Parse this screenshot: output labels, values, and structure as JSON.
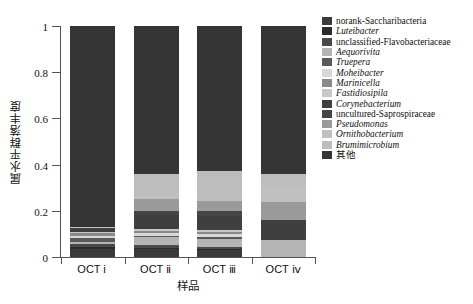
{
  "chart_data": {
    "type": "bar",
    "subtype": "stacked-bar",
    "title": "",
    "xlabel": "样品",
    "ylabel": "属水平群落丰度",
    "categories": [
      "OCT ⅰ",
      "OCT ⅱ",
      "OCT ⅲ",
      "OCT ⅳ"
    ],
    "ylim": [
      0,
      1
    ],
    "yticks": [
      0,
      0.2,
      0.4,
      0.6,
      0.8,
      1
    ],
    "ytick_labels": [
      "0",
      "0.2",
      "0.4",
      "0.6",
      "0.8",
      "1"
    ],
    "grid": false,
    "legend_position": "right",
    "stack_order_bottom_to_top": [
      "norank-Saccharibacteria",
      "Luteibacter",
      "unclassified-Flavobacteriaceae",
      "Aequorivita",
      "Truepera",
      "Moheibacter",
      "Marinicella",
      "Fastidiosipila",
      "Corynebacterium",
      "uncultured-Saprospiraceae",
      "Pseudomonas",
      "Ornithobacterium",
      "Brumimicrobium",
      "其他"
    ],
    "series": [
      {
        "name": "norank-Saccharibacteria",
        "color": "#3a3a3a",
        "values": [
          0.035,
          0.035,
          0.03,
          0.0
        ]
      },
      {
        "name": "Luteibacter",
        "color": "#2b2b2b",
        "values": [
          0.01,
          0.005,
          0.005,
          0.0
        ]
      },
      {
        "name": "unclassified-Flavobacteriaceae",
        "color": "#4a4a4a",
        "values": [
          0.01,
          0.01,
          0.01,
          0.0
        ]
      },
      {
        "name": "Aequorivita",
        "color": "#b4b4b4",
        "values": [
          0.008,
          0.035,
          0.035,
          0.075
        ]
      },
      {
        "name": "Truepera",
        "color": "#5a5a5a",
        "values": [
          0.02,
          0.008,
          0.008,
          0.0
        ]
      },
      {
        "name": "Moheibacter",
        "color": "#d8d8d8",
        "values": [
          0.008,
          0.01,
          0.01,
          0.0
        ]
      },
      {
        "name": "Marinicella",
        "color": "#8a8a8a",
        "values": [
          0.015,
          0.012,
          0.012,
          0.0
        ]
      },
      {
        "name": "Fastidiosipila",
        "color": "#c8c8c8",
        "values": [
          0.004,
          0.008,
          0.008,
          0.0
        ]
      },
      {
        "name": "Corynebacterium",
        "color": "#3f3f3f",
        "values": [
          0.01,
          0.06,
          0.062,
          0.085
        ]
      },
      {
        "name": "uncultured-Saprospiraceae",
        "color": "#454545",
        "values": [
          0.005,
          0.015,
          0.018,
          0.0
        ]
      },
      {
        "name": "Pseudomonas",
        "color": "#9a9a9a",
        "values": [
          0.003,
          0.055,
          0.045,
          0.08
        ]
      },
      {
        "name": "Ornithobacterium",
        "color": "#c0c0c0",
        "values": [
          0.002,
          0.01,
          0.01,
          0.065
        ]
      },
      {
        "name": "Brumimicrobium",
        "color": "#bdbdbd",
        "values": [
          0.0,
          0.097,
          0.12,
          0.055
        ]
      },
      {
        "name": "其他",
        "color": "#353535",
        "values": [
          0.87,
          0.64,
          0.627,
          0.64
        ]
      }
    ]
  },
  "legend": {
    "items": [
      {
        "label": "norank-Saccharibacteria",
        "color": "#3a3a3a",
        "italic": false,
        "cjk": false
      },
      {
        "label": "Luteibacter",
        "color": "#2b2b2b",
        "italic": true,
        "cjk": false
      },
      {
        "label": "unclassified-Flavobacteriaceae",
        "color": "#4a4a4a",
        "italic": false,
        "cjk": false
      },
      {
        "label": "Aequorivita",
        "color": "#b4b4b4",
        "italic": true,
        "cjk": false
      },
      {
        "label": "Truepera",
        "color": "#5a5a5a",
        "italic": true,
        "cjk": false
      },
      {
        "label": "Moheibacter",
        "color": "#d8d8d8",
        "italic": true,
        "cjk": false
      },
      {
        "label": "Marinicella",
        "color": "#8a8a8a",
        "italic": true,
        "cjk": false
      },
      {
        "label": "Fastidiosipila",
        "color": "#c8c8c8",
        "italic": true,
        "cjk": false
      },
      {
        "label": "Corynebacterium",
        "color": "#3f3f3f",
        "italic": true,
        "cjk": false
      },
      {
        "label": "uncultured-Saprospiraceae",
        "color": "#454545",
        "italic": false,
        "cjk": false
      },
      {
        "label": "Pseudomonas",
        "color": "#9a9a9a",
        "italic": true,
        "cjk": false
      },
      {
        "label": "Ornithobacterium",
        "color": "#c0c0c0",
        "italic": true,
        "cjk": false
      },
      {
        "label": "Brumimicrobium",
        "color": "#bdbdbd",
        "italic": true,
        "cjk": false
      },
      {
        "label": "其他",
        "color": "#353535",
        "italic": false,
        "cjk": true
      }
    ]
  },
  "axis": {
    "line_color": "#555555"
  }
}
